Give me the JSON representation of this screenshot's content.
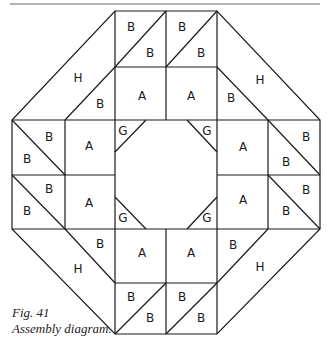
{
  "figure": {
    "caption_number": "Fig. 41",
    "caption_title": "Assembly diagram."
  },
  "diagram": {
    "type": "quilt assembly diagram (octagonal ring)",
    "piece_labels": [
      "A",
      "B",
      "G",
      "H"
    ],
    "counts": {
      "A": 8,
      "B": 24,
      "G": 4,
      "H": 4
    },
    "labels": [
      {
        "t": "B",
        "x": 131,
        "y": 27
      },
      {
        "t": "B",
        "x": 150,
        "y": 53
      },
      {
        "t": "B",
        "x": 182,
        "y": 27
      },
      {
        "t": "B",
        "x": 201,
        "y": 53
      },
      {
        "t": "H",
        "x": 78,
        "y": 78
      },
      {
        "t": "B",
        "x": 100,
        "y": 104
      },
      {
        "t": "A",
        "x": 142,
        "y": 96
      },
      {
        "t": "A",
        "x": 191,
        "y": 96
      },
      {
        "t": "B",
        "x": 231,
        "y": 98
      },
      {
        "t": "H",
        "x": 260,
        "y": 80
      },
      {
        "t": "B",
        "x": 49,
        "y": 137
      },
      {
        "t": "B",
        "x": 27,
        "y": 159
      },
      {
        "t": "A",
        "x": 89,
        "y": 146
      },
      {
        "t": "G",
        "x": 123,
        "y": 131
      },
      {
        "t": "G",
        "x": 207,
        "y": 131
      },
      {
        "t": "A",
        "x": 243,
        "y": 147
      },
      {
        "t": "B",
        "x": 306,
        "y": 137
      },
      {
        "t": "B",
        "x": 286,
        "y": 162
      },
      {
        "t": "B",
        "x": 49,
        "y": 189
      },
      {
        "t": "B",
        "x": 27,
        "y": 211
      },
      {
        "t": "A",
        "x": 89,
        "y": 203
      },
      {
        "t": "G",
        "x": 123,
        "y": 218
      },
      {
        "t": "G",
        "x": 207,
        "y": 218
      },
      {
        "t": "A",
        "x": 243,
        "y": 200
      },
      {
        "t": "B",
        "x": 306,
        "y": 190
      },
      {
        "t": "B",
        "x": 286,
        "y": 211
      },
      {
        "t": "H",
        "x": 78,
        "y": 269
      },
      {
        "t": "B",
        "x": 100,
        "y": 244
      },
      {
        "t": "A",
        "x": 142,
        "y": 253
      },
      {
        "t": "A",
        "x": 191,
        "y": 253
      },
      {
        "t": "B",
        "x": 233,
        "y": 245
      },
      {
        "t": "H",
        "x": 260,
        "y": 267
      },
      {
        "t": "B",
        "x": 131,
        "y": 297
      },
      {
        "t": "B",
        "x": 150,
        "y": 318
      },
      {
        "t": "B",
        "x": 182,
        "y": 297
      },
      {
        "t": "B",
        "x": 201,
        "y": 318
      }
    ]
  }
}
